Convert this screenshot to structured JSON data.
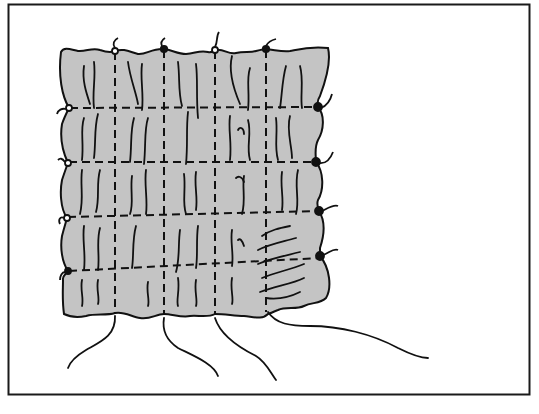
{
  "figure": {
    "title": "Smocked fabric swatch with gathering threads",
    "colors": {
      "background": "#ffffff",
      "frame": "#1a1a1a",
      "fabric": "#c4c4c4",
      "ink": "#111111"
    },
    "grid": {
      "vertical_stitch_lines_x": [
        115,
        164,
        215,
        266
      ],
      "horizontal_stitch_lines_y": [
        108,
        160,
        216,
        271
      ],
      "top_knots": [
        {
          "x": 115,
          "y": 51,
          "style": "open"
        },
        {
          "x": 164,
          "y": 49,
          "style": "filled"
        },
        {
          "x": 215,
          "y": 50,
          "style": "open"
        },
        {
          "x": 266,
          "y": 49,
          "style": "filled"
        }
      ],
      "left_knots": [
        {
          "x": 69,
          "y": 108,
          "style": "open"
        },
        {
          "x": 68,
          "y": 163,
          "style": "open"
        },
        {
          "x": 67,
          "y": 218,
          "style": "open"
        },
        {
          "x": 68,
          "y": 271,
          "style": "filled"
        }
      ],
      "right_knots": [
        {
          "x": 318,
          "y": 107,
          "style": "filled"
        },
        {
          "x": 316,
          "y": 162,
          "style": "filled"
        },
        {
          "x": 319,
          "y": 211,
          "style": "filled"
        },
        {
          "x": 320,
          "y": 256,
          "style": "filled"
        }
      ],
      "bottom_threads": 4
    }
  }
}
